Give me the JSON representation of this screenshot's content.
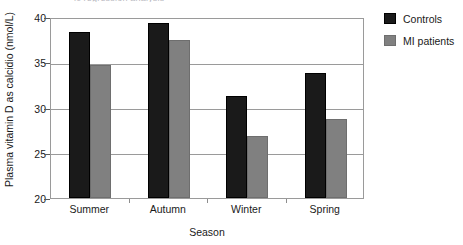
{
  "caption_remnant": "ic regression analysis",
  "chart_data": {
    "type": "bar",
    "title": "",
    "xlabel": "Season",
    "ylabel": "Plasma vitamin D as calcidio (nmol/L)",
    "categories": [
      "Summer",
      "Autumn",
      "Winter",
      "Spring"
    ],
    "series": [
      {
        "name": "Controls",
        "color": "#1a1a1a",
        "values": [
          38.3,
          39.3,
          31.3,
          33.8
        ]
      },
      {
        "name": "MI patients",
        "color": "#808080",
        "values": [
          34.7,
          37.5,
          26.9,
          28.7
        ]
      }
    ],
    "ylim": [
      20,
      40
    ],
    "yticks": [
      20,
      25,
      30,
      35,
      40
    ],
    "ytick_labels": [
      "20",
      "25",
      "30",
      "35",
      "40"
    ],
    "grid": true,
    "legend_position": "right"
  }
}
